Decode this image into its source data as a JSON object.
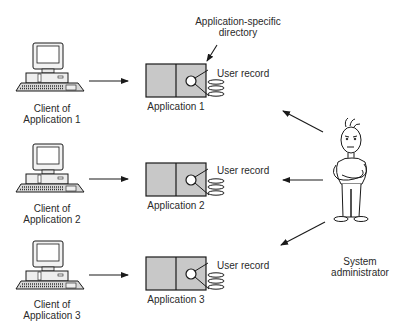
{
  "diagram": {
    "annotation": {
      "line1": "Application-specific",
      "line2": "directory"
    },
    "rows": [
      {
        "client_line1": "Client of",
        "client_line2": "Application 1",
        "app_label": "Application 1",
        "record_label": "User record"
      },
      {
        "client_line1": "Client of",
        "client_line2": "Application 2",
        "app_label": "Application 2",
        "record_label": "User record"
      },
      {
        "client_line1": "Client of",
        "client_line2": "Application 3",
        "app_label": "Application 3",
        "record_label": "User record"
      }
    ],
    "admin": {
      "line1": "System",
      "line2": "administrator"
    },
    "colors": {
      "box_fill": "#c8c8c8",
      "stroke": "#1a1a1a",
      "background": "#ffffff"
    }
  }
}
